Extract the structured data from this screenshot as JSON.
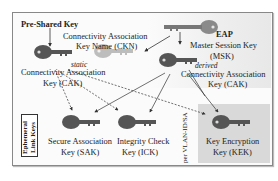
{
  "diagram": {
    "labels": {
      "psk": "Pre-Shared Key",
      "ckn_line1": "Connectivity Association",
      "ckn_line2": "Key Name (CKN)",
      "static": "static",
      "cak_left_line1": "Connectivity Association",
      "cak_left_line2": "Key (CAK)",
      "eap": "EAP",
      "msk_line1": "Master Session Key",
      "msk_line2": "(MSK)",
      "derived": "derived",
      "cak_right_line1": "Connectivity Association",
      "cak_right_line2": "Key (CAK)",
      "sak_line1": "Secure Association",
      "sak_line2": "Key (SAK)",
      "ick_line1": "Integrity Check",
      "ick_line2": "Key (ICK)",
      "kek_line1": "Key Encryption",
      "kek_line2": "Key (KEK)",
      "ephemeral": "Ephemeral Link Keys",
      "per_vlan": "per VLAN-ID/SA"
    },
    "colors": {
      "key_dark": "#555555",
      "key_light": "#bdbdbd",
      "key_msk": "#8a8a8a",
      "kek_bg": "#d9d9d9"
    }
  }
}
